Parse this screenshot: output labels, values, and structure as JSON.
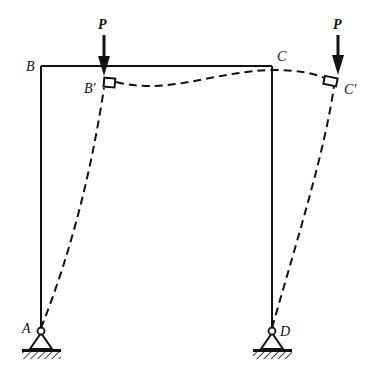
{
  "diagram": {
    "type": "portal-frame-buckling",
    "labels": {
      "B": "B",
      "B_prime": "B′",
      "C": "C",
      "C_prime": "C′",
      "A": "A",
      "D": "D",
      "load_left": "P",
      "load_right": "P"
    },
    "colors": {
      "line": "#111111",
      "background": "#ffffff"
    }
  }
}
